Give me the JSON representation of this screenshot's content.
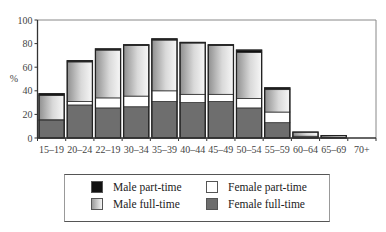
{
  "chart_data": {
    "type": "bar",
    "stacked": true,
    "title": "",
    "xlabel": "",
    "ylabel": "%",
    "ylim": [
      0,
      100
    ],
    "yticks": [
      0,
      20,
      40,
      60,
      80,
      100
    ],
    "grid": false,
    "legend_position": "bottom",
    "categories": [
      "15–19",
      "20–24",
      "22–19",
      "30–34",
      "35–39",
      "40–44",
      "45–49",
      "50–54",
      "55–59",
      "60–64",
      "65–69",
      "70+"
    ],
    "series": [
      {
        "name": "Female full-time",
        "color": "#6e6e6e",
        "values": [
          15,
          28,
          25.5,
          26.5,
          31,
          30,
          31,
          25.5,
          13,
          1.5,
          0.5,
          0
        ]
      },
      {
        "name": "Female part-time",
        "color": "#ffffff",
        "values": [
          0.5,
          3,
          8.5,
          9,
          9,
          7,
          6,
          8,
          9,
          0,
          0,
          0
        ]
      },
      {
        "name": "Male full-time",
        "color": "#c8c8c8",
        "values": [
          20.5,
          33.5,
          40.5,
          43,
          43,
          43.5,
          41.5,
          39,
          19,
          3.5,
          1.5,
          0
        ]
      },
      {
        "name": "Male part-time",
        "color": "#111111",
        "values": [
          1.5,
          1,
          1,
          0.5,
          1,
          0.5,
          0.5,
          2,
          1.5,
          0,
          0,
          0
        ]
      }
    ]
  },
  "legend": {
    "items": [
      {
        "label": "Male part-time",
        "swatch": "male-part-time"
      },
      {
        "label": "Female part-time",
        "swatch": "female-part-time"
      },
      {
        "label": "Male full-time",
        "swatch": "male-full-time"
      },
      {
        "label": "Female full-time",
        "swatch": "female-full-time"
      }
    ]
  }
}
